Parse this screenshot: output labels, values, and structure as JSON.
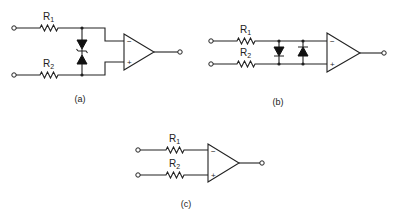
{
  "figure": {
    "panels": [
      {
        "id": "a",
        "caption": "(a)",
        "resistors": [
          {
            "name": "R",
            "sub": "1"
          },
          {
            "name": "R",
            "sub": "2"
          }
        ],
        "clamp": "back-to-back zener diodes",
        "opamp": {
          "inverting": "−",
          "noninverting": "+"
        }
      },
      {
        "id": "b",
        "caption": "(b)",
        "resistors": [
          {
            "name": "R",
            "sub": "1"
          },
          {
            "name": "R",
            "sub": "2"
          }
        ],
        "clamp": "anti-parallel diodes",
        "opamp": {
          "inverting": "−",
          "noninverting": "+"
        }
      },
      {
        "id": "c",
        "caption": "(c)",
        "resistors": [
          {
            "name": "R",
            "sub": "1"
          },
          {
            "name": "R",
            "sub": "2"
          }
        ],
        "clamp": "none",
        "opamp": {
          "inverting": "−",
          "noninverting": "+"
        }
      }
    ]
  },
  "colors": {
    "ink": "#222222",
    "background": "#ffffff"
  }
}
